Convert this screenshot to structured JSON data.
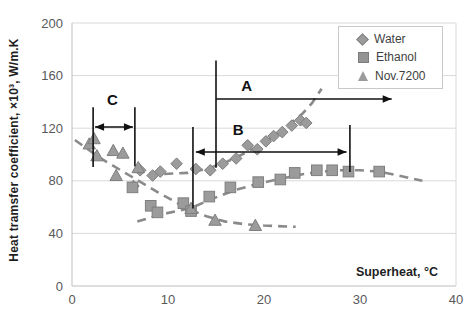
{
  "chart_data": {
    "type": "scatter",
    "title": "",
    "xlabel": "Superheat, °C",
    "ylabel": "Heat tramsfer coefficient, ×10³, W/m.K",
    "xlim": [
      0,
      40
    ],
    "ylim": [
      0,
      200
    ],
    "xticks": [
      0,
      10,
      20,
      30,
      40
    ],
    "yticks": [
      0,
      40,
      80,
      120,
      160,
      200
    ],
    "grid": "horizontal",
    "legend_position": "top-right",
    "series": [
      {
        "name": "Water",
        "marker": "diamond",
        "points": [
          [
            6.4,
            76
          ],
          [
            7.1,
            88
          ],
          [
            8.4,
            84
          ],
          [
            9.2,
            87
          ],
          [
            10.9,
            93
          ],
          [
            12.9,
            89
          ],
          [
            14.4,
            88
          ],
          [
            15.7,
            93
          ],
          [
            17.1,
            97
          ],
          [
            18.3,
            107
          ],
          [
            19.3,
            104
          ],
          [
            20.2,
            110
          ],
          [
            21.0,
            114
          ],
          [
            21.9,
            117
          ],
          [
            22.9,
            122
          ],
          [
            23.8,
            126
          ],
          [
            24.4,
            124
          ]
        ],
        "trend": [
          [
            6.5,
            87
          ],
          [
            9,
            85
          ],
          [
            12,
            86
          ],
          [
            14,
            89
          ],
          [
            16,
            94
          ],
          [
            18,
            101
          ],
          [
            20,
            109
          ],
          [
            22,
            119
          ],
          [
            24,
            131
          ],
          [
            25,
            139
          ],
          [
            26,
            150
          ]
        ]
      },
      {
        "name": "Ethanol",
        "marker": "square",
        "points": [
          [
            6.3,
            75
          ],
          [
            8.2,
            61
          ],
          [
            8.9,
            56
          ],
          [
            11.6,
            63
          ],
          [
            12.4,
            57
          ],
          [
            14.3,
            68
          ],
          [
            16.5,
            75
          ],
          [
            19.4,
            79
          ],
          [
            21.7,
            81
          ],
          [
            23.2,
            86
          ],
          [
            25.5,
            88
          ],
          [
            27.1,
            88
          ],
          [
            28.8,
            87
          ],
          [
            32.0,
            87
          ]
        ],
        "trend": [
          [
            6.8,
            49
          ],
          [
            9,
            54
          ],
          [
            12.3,
            59
          ],
          [
            14.5,
            66
          ],
          [
            17,
            73
          ],
          [
            19.5,
            78
          ],
          [
            22,
            82
          ],
          [
            24,
            85
          ],
          [
            26,
            87
          ],
          [
            28,
            88
          ],
          [
            30,
            88
          ],
          [
            32,
            87
          ],
          [
            34,
            84
          ],
          [
            36.5,
            80
          ]
        ]
      },
      {
        "name": "Nov.7200",
        "marker": "triangle",
        "points": [
          [
            1.8,
            108
          ],
          [
            2.3,
            112
          ],
          [
            2.6,
            99
          ],
          [
            4.3,
            103
          ],
          [
            4.6,
            84
          ],
          [
            5.3,
            101
          ],
          [
            6.9,
            90
          ],
          [
            12.4,
            59
          ],
          [
            14.9,
            50
          ],
          [
            19.1,
            46
          ]
        ],
        "trend": [
          [
            0.3,
            111
          ],
          [
            3,
            97
          ],
          [
            6,
            84
          ],
          [
            9,
            71
          ],
          [
            12,
            59
          ],
          [
            14,
            53
          ],
          [
            16,
            49
          ],
          [
            18,
            47
          ],
          [
            20,
            46
          ],
          [
            23.3,
            45
          ]
        ]
      }
    ],
    "annotations": {
      "vlines": [
        {
          "x": 15.0,
          "y1": 90,
          "y2": 171.5
        },
        {
          "x": 12.6,
          "y1": 59,
          "y2": 121
        },
        {
          "x": 28.95,
          "y1": 86.7,
          "y2": 122.4
        },
        {
          "x": 2.2,
          "y1": 90.5,
          "y2": 136
        },
        {
          "x": 6.55,
          "y1": 91,
          "y2": 136
        }
      ],
      "arrows": [
        {
          "y": 142.2,
          "x1": 15.0,
          "x2": 33.3,
          "heads": "right"
        },
        {
          "y": 101.9,
          "x1": 12.9,
          "x2": 28.6,
          "heads": "both"
        },
        {
          "y": 120.9,
          "x1": 2.4,
          "x2": 6.35,
          "heads": "both"
        }
      ],
      "labels": [
        {
          "text": "A",
          "x": 18.2,
          "y": 152
        },
        {
          "text": "B",
          "x": 17.3,
          "y": 119
        },
        {
          "text": "C",
          "x": 4.2,
          "y": 141.5
        }
      ]
    },
    "colors": {
      "marker": "#9b9b9b",
      "marker_edge": "#7e7e7e",
      "trend": "#8a8a8a",
      "grid": "#d9d9d9",
      "axis": "#bdbdbd",
      "tick_text": "#595959",
      "annotation": "#111111"
    }
  }
}
